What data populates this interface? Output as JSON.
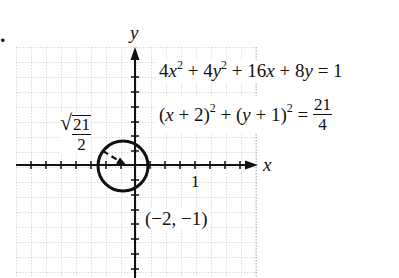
{
  "problem_marker": ".",
  "axes": {
    "x_label": "x",
    "y_label": "y",
    "tick_label_x": "1"
  },
  "equations": {
    "general_form": {
      "t1": "4",
      "v1": "x",
      "e1": "2",
      "op1": " + ",
      "t2": "4",
      "v2": "y",
      "e2": "2",
      "op2": " + 16",
      "v3": "x",
      "op3": " + 8",
      "v4": "y",
      "rhs": " = 1"
    },
    "standard_form": {
      "p1_open": "(",
      "p1_var": "x",
      "p1_rest": " + 2)",
      "p1_exp": "2",
      "op": " + ",
      "p2_open": "(",
      "p2_var": "y",
      "p2_rest": " + 1)",
      "p2_exp": "2",
      "eq": " = ",
      "rhs_num": "21",
      "rhs_den": "4"
    }
  },
  "annotations": {
    "radius_label": {
      "sqrt_symbol": "√",
      "num": "21",
      "den": "2"
    },
    "center_label": "(−2, −1)"
  },
  "colors": {
    "grid": "#9a9a9a",
    "ink": "#111111",
    "background": "#ffffff"
  }
}
